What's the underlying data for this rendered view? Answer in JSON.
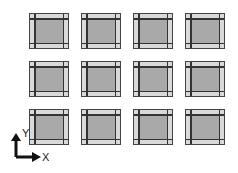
{
  "grid": {
    "rows": 3,
    "cols": 4,
    "col_x": [
      29,
      81,
      133,
      185
    ],
    "row_y": [
      13,
      61,
      109
    ],
    "tile_colors": {
      "border": "#444444",
      "band": "#d9d9d9",
      "fill": "#a9a9a9"
    }
  },
  "axes": {
    "y_label": "Y",
    "x_label": "X"
  }
}
